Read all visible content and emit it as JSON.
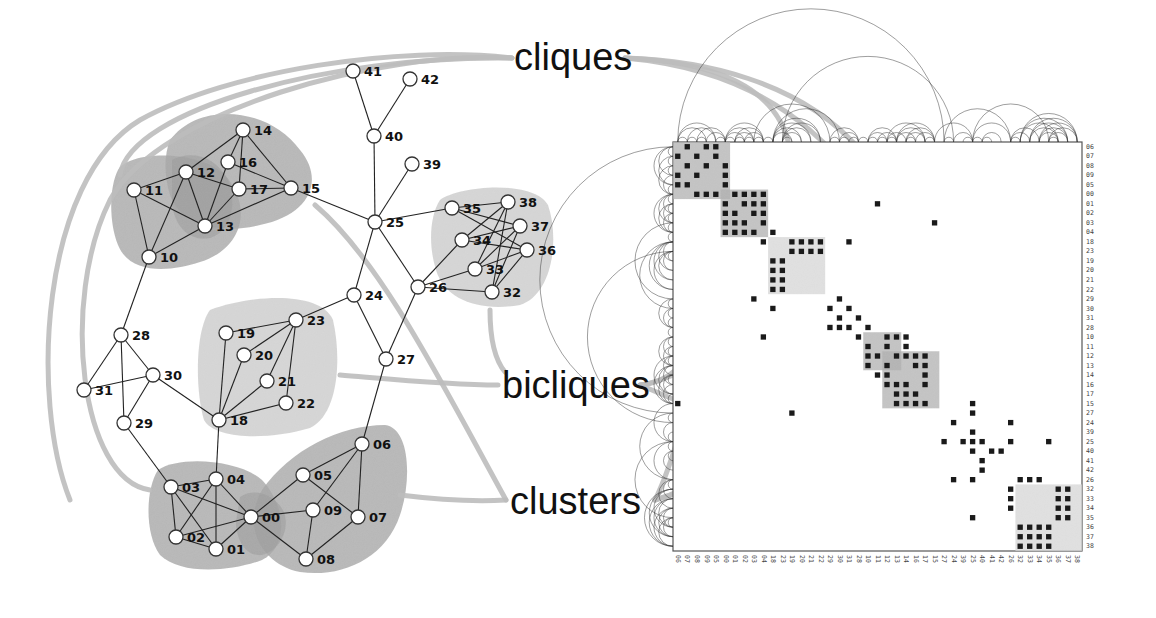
{
  "callouts": {
    "cliques": {
      "label": "cliques",
      "x": 514,
      "y": 40
    },
    "bicliques": {
      "label": "bicliques",
      "x": 502,
      "y": 368
    },
    "clusters": {
      "label": "clusters",
      "x": 510,
      "y": 483
    }
  },
  "colors": {
    "node_fill": "#ffffff",
    "node_stroke": "#333333",
    "edge": "#222222",
    "clique_hull": "#9a9a9a",
    "biclique_hull": "#cfcfcf",
    "cluster_hull": "#a8a8a8",
    "leader_line": "#bdbdbd",
    "matrix_cell": "#1a1a1a",
    "matrix_border": "#555555",
    "arc": "#333333"
  },
  "graph": {
    "nodes": [
      {
        "id": "00",
        "x": 251,
        "y": 517
      },
      {
        "id": "01",
        "x": 216,
        "y": 549
      },
      {
        "id": "02",
        "x": 176,
        "y": 537
      },
      {
        "id": "03",
        "x": 171,
        "y": 487
      },
      {
        "id": "04",
        "x": 216,
        "y": 479
      },
      {
        "id": "05",
        "x": 303,
        "y": 475
      },
      {
        "id": "06",
        "x": 362,
        "y": 444
      },
      {
        "id": "07",
        "x": 358,
        "y": 517
      },
      {
        "id": "08",
        "x": 306,
        "y": 559
      },
      {
        "id": "09",
        "x": 313,
        "y": 510
      },
      {
        "id": "10",
        "x": 149,
        "y": 257
      },
      {
        "id": "11",
        "x": 134,
        "y": 190
      },
      {
        "id": "12",
        "x": 186,
        "y": 172
      },
      {
        "id": "13",
        "x": 205,
        "y": 226
      },
      {
        "id": "14",
        "x": 243,
        "y": 130
      },
      {
        "id": "15",
        "x": 291,
        "y": 188
      },
      {
        "id": "16",
        "x": 228,
        "y": 162
      },
      {
        "id": "17",
        "x": 239,
        "y": 189
      },
      {
        "id": "18",
        "x": 219,
        "y": 420
      },
      {
        "id": "19",
        "x": 226,
        "y": 333
      },
      {
        "id": "20",
        "x": 244,
        "y": 355
      },
      {
        "id": "21",
        "x": 267,
        "y": 381
      },
      {
        "id": "22",
        "x": 286,
        "y": 403
      },
      {
        "id": "23",
        "x": 296,
        "y": 320
      },
      {
        "id": "24",
        "x": 354,
        "y": 295
      },
      {
        "id": "25",
        "x": 375,
        "y": 222
      },
      {
        "id": "26",
        "x": 418,
        "y": 287
      },
      {
        "id": "27",
        "x": 386,
        "y": 359
      },
      {
        "id": "28",
        "x": 121,
        "y": 335
      },
      {
        "id": "29",
        "x": 124,
        "y": 423
      },
      {
        "id": "30",
        "x": 153,
        "y": 375
      },
      {
        "id": "31",
        "x": 84,
        "y": 390
      },
      {
        "id": "32",
        "x": 492,
        "y": 292
      },
      {
        "id": "33",
        "x": 475,
        "y": 269
      },
      {
        "id": "34",
        "x": 462,
        "y": 240
      },
      {
        "id": "35",
        "x": 452,
        "y": 208
      },
      {
        "id": "36",
        "x": 527,
        "y": 250
      },
      {
        "id": "37",
        "x": 520,
        "y": 226
      },
      {
        "id": "38",
        "x": 508,
        "y": 202
      },
      {
        "id": "39",
        "x": 412,
        "y": 164
      },
      {
        "id": "40",
        "x": 374,
        "y": 136
      },
      {
        "id": "41",
        "x": 353,
        "y": 71
      },
      {
        "id": "42",
        "x": 410,
        "y": 79
      }
    ],
    "edges": [
      [
        "41",
        "40"
      ],
      [
        "42",
        "40"
      ],
      [
        "40",
        "25"
      ],
      [
        "39",
        "25"
      ],
      [
        "25",
        "15"
      ],
      [
        "25",
        "24"
      ],
      [
        "25",
        "26"
      ],
      [
        "25",
        "35"
      ],
      [
        "24",
        "23"
      ],
      [
        "24",
        "27"
      ],
      [
        "26",
        "27"
      ],
      [
        "26",
        "34"
      ],
      [
        "26",
        "33"
      ],
      [
        "26",
        "32"
      ],
      [
        "35",
        "38"
      ],
      [
        "35",
        "37"
      ],
      [
        "35",
        "36"
      ],
      [
        "34",
        "38"
      ],
      [
        "34",
        "37"
      ],
      [
        "34",
        "36"
      ],
      [
        "33",
        "38"
      ],
      [
        "33",
        "37"
      ],
      [
        "33",
        "36"
      ],
      [
        "32",
        "38"
      ],
      [
        "32",
        "37"
      ],
      [
        "32",
        "36"
      ],
      [
        "14",
        "12"
      ],
      [
        "14",
        "16"
      ],
      [
        "14",
        "17"
      ],
      [
        "14",
        "15"
      ],
      [
        "16",
        "15"
      ],
      [
        "16",
        "13"
      ],
      [
        "12",
        "17"
      ],
      [
        "12",
        "11"
      ],
      [
        "12",
        "13"
      ],
      [
        "12",
        "10"
      ],
      [
        "11",
        "10"
      ],
      [
        "11",
        "13"
      ],
      [
        "13",
        "17"
      ],
      [
        "13",
        "15"
      ],
      [
        "17",
        "15"
      ],
      [
        "13",
        "10"
      ],
      [
        "10",
        "28"
      ],
      [
        "28",
        "31"
      ],
      [
        "28",
        "30"
      ],
      [
        "28",
        "29"
      ],
      [
        "31",
        "30"
      ],
      [
        "30",
        "29"
      ],
      [
        "30",
        "18"
      ],
      [
        "29",
        "03"
      ],
      [
        "23",
        "19"
      ],
      [
        "23",
        "20"
      ],
      [
        "23",
        "21"
      ],
      [
        "23",
        "22"
      ],
      [
        "18",
        "19"
      ],
      [
        "18",
        "20"
      ],
      [
        "18",
        "21"
      ],
      [
        "18",
        "22"
      ],
      [
        "18",
        "04"
      ],
      [
        "27",
        "06"
      ],
      [
        "03",
        "04"
      ],
      [
        "03",
        "02"
      ],
      [
        "03",
        "01"
      ],
      [
        "03",
        "00"
      ],
      [
        "04",
        "02"
      ],
      [
        "04",
        "01"
      ],
      [
        "04",
        "00"
      ],
      [
        "02",
        "01"
      ],
      [
        "02",
        "00"
      ],
      [
        "01",
        "00"
      ],
      [
        "00",
        "05"
      ],
      [
        "00",
        "09"
      ],
      [
        "00",
        "08"
      ],
      [
        "05",
        "06"
      ],
      [
        "05",
        "07"
      ],
      [
        "06",
        "09"
      ],
      [
        "06",
        "07"
      ],
      [
        "07",
        "08"
      ],
      [
        "09",
        "08"
      ]
    ],
    "hulls": [
      {
        "kind": "cluster",
        "name": "cluster-10-13",
        "path": "M 118 170 C 130 150 200 150 225 175 C 255 210 240 250 200 262 C 170 272 130 275 118 245 C 108 220 110 185 118 170 Z"
      },
      {
        "kind": "cluster",
        "name": "cluster-12-17",
        "path": "M 170 140 C 200 100 270 108 300 150 C 325 180 310 215 260 225 C 220 235 180 225 170 195 C 164 175 164 155 170 140 Z"
      },
      {
        "kind": "clique",
        "name": "clique-12-13-overlap",
        "path": "M 172 160 C 190 150 215 155 228 180 C 238 205 230 232 210 238 C 188 242 175 225 172 205 Z"
      },
      {
        "kind": "biclique",
        "name": "biclique-18-23",
        "path": "M 210 310 C 250 295 320 290 333 320 C 342 360 338 415 310 428 C 270 440 215 440 204 420 C 195 390 195 330 210 310 Z"
      },
      {
        "kind": "biclique",
        "name": "biclique-32-38",
        "path": "M 440 200 C 460 185 535 180 548 205 C 560 240 552 295 520 305 C 480 312 445 300 436 270 C 428 245 430 215 440 200 Z"
      },
      {
        "kind": "cluster",
        "name": "cluster-00-04",
        "path": "M 158 470 C 180 455 240 460 262 480 C 285 505 290 545 262 560 C 230 572 180 575 160 555 C 145 535 145 490 158 470 Z"
      },
      {
        "kind": "cluster",
        "name": "cluster-05-09",
        "path": "M 262 490 C 290 450 340 425 385 425 C 410 428 412 480 400 515 C 385 560 340 578 300 572 C 265 565 240 530 262 490 Z"
      },
      {
        "kind": "clique",
        "name": "clique-00-overlap",
        "path": "M 240 497 C 255 487 275 495 284 512 C 290 530 280 550 262 555 C 246 557 236 540 236 522 Z"
      }
    ],
    "leader_lines": [
      {
        "to": "cliques",
        "path": "M 120 175 C 130 110 330 55 512 58"
      },
      {
        "to": "cliques",
        "path": "M 70 500 C 30 400 40 180 140 120 C 230 70 400 45 512 58"
      },
      {
        "to": "cliques",
        "path": "M 150 490 C 80 480 60 300 110 200 C 160 110 380 50 512 58"
      },
      {
        "to": "cliques",
        "path": "M 625 58 C 720 62 780 90 790 150"
      },
      {
        "to": "cliques",
        "path": "M 625 58 C 760 70 880 140 925 345"
      },
      {
        "to": "cliques",
        "path": "M 625 58 C 700 60 800 80 860 150 C 900 220 880 345 880 360"
      },
      {
        "to": "bicliques",
        "path": "M 340 375 C 400 380 450 385 498 385"
      },
      {
        "to": "bicliques",
        "path": "M 490 310 C 490 340 495 360 505 372"
      },
      {
        "to": "bicliques",
        "path": "M 640 385 C 680 380 760 330 810 302"
      },
      {
        "to": "bicliques",
        "path": "M 640 385 C 700 380 720 300 710 210"
      },
      {
        "to": "bicliques",
        "path": "M 640 385 C 700 410 900 500 1025 540"
      },
      {
        "to": "clusters",
        "path": "M 315 205 C 380 260 440 380 506 500"
      },
      {
        "to": "clusters",
        "path": "M 400 495 C 440 500 470 502 506 500"
      },
      {
        "to": "clusters",
        "path": "M 655 500 C 720 480 800 450 888 425"
      },
      {
        "to": "clusters",
        "path": "M 655 500 C 680 450 700 350 710 310"
      },
      {
        "to": "clusters",
        "path": "M 655 500 C 690 490 740 460 760 420"
      }
    ]
  },
  "matrix": {
    "x": 673,
    "y": 142,
    "size": 409,
    "n": 43,
    "order": [
      "06",
      "07",
      "08",
      "09",
      "05",
      "00",
      "01",
      "02",
      "03",
      "04",
      "18",
      "23",
      "19",
      "20",
      "21",
      "22",
      "29",
      "30",
      "31",
      "28",
      "10",
      "11",
      "12",
      "13",
      "14",
      "16",
      "17",
      "15",
      "27",
      "24",
      "39",
      "25",
      "40",
      "41",
      "42",
      "26",
      "32",
      "33",
      "34",
      "35",
      "36",
      "37",
      "38"
    ],
    "blocks": [
      {
        "kind": "cluster",
        "r0": 0,
        "r1": 5,
        "c0": 0,
        "c1": 5
      },
      {
        "kind": "cluster",
        "r0": 5,
        "r1": 9,
        "c0": 5,
        "c1": 9
      },
      {
        "kind": "biclique",
        "r0": 10,
        "r1": 15,
        "c0": 10,
        "c1": 15
      },
      {
        "kind": "cluster",
        "r0": 20,
        "r1": 23,
        "c0": 20,
        "c1": 23
      },
      {
        "kind": "cluster",
        "r0": 22,
        "r1": 27,
        "c0": 22,
        "c1": 27
      },
      {
        "kind": "biclique",
        "r0": 36,
        "r1": 42,
        "c0": 36,
        "c1": 42
      }
    ],
    "cells": [
      [
        0,
        1
      ],
      [
        0,
        3
      ],
      [
        0,
        4
      ],
      [
        1,
        0
      ],
      [
        1,
        2
      ],
      [
        1,
        4
      ],
      [
        2,
        1
      ],
      [
        2,
        3
      ],
      [
        2,
        5
      ],
      [
        3,
        0
      ],
      [
        3,
        2
      ],
      [
        3,
        5
      ],
      [
        4,
        0
      ],
      [
        4,
        1
      ],
      [
        4,
        5
      ],
      [
        5,
        2
      ],
      [
        5,
        3
      ],
      [
        5,
        4
      ],
      [
        5,
        6
      ],
      [
        5,
        7
      ],
      [
        5,
        8
      ],
      [
        5,
        9
      ],
      [
        6,
        5
      ],
      [
        6,
        7
      ],
      [
        6,
        8
      ],
      [
        6,
        9
      ],
      [
        7,
        5
      ],
      [
        7,
        6
      ],
      [
        7,
        8
      ],
      [
        7,
        9
      ],
      [
        8,
        5
      ],
      [
        8,
        6
      ],
      [
        8,
        7
      ],
      [
        8,
        9
      ],
      [
        9,
        5
      ],
      [
        9,
        6
      ],
      [
        9,
        7
      ],
      [
        9,
        8
      ],
      [
        9,
        10
      ],
      [
        10,
        9
      ],
      [
        10,
        12
      ],
      [
        10,
        13
      ],
      [
        10,
        14
      ],
      [
        10,
        15
      ],
      [
        10,
        18
      ],
      [
        11,
        12
      ],
      [
        11,
        13
      ],
      [
        11,
        14
      ],
      [
        11,
        15
      ],
      [
        12,
        10
      ],
      [
        12,
        11
      ],
      [
        13,
        10
      ],
      [
        13,
        11
      ],
      [
        14,
        10
      ],
      [
        14,
        11
      ],
      [
        15,
        10
      ],
      [
        15,
        11
      ],
      [
        6,
        21
      ],
      [
        16,
        8
      ],
      [
        17,
        16
      ],
      [
        16,
        17
      ],
      [
        17,
        18
      ],
      [
        18,
        17
      ],
      [
        18,
        19
      ],
      [
        19,
        16
      ],
      [
        19,
        17
      ],
      [
        19,
        18
      ],
      [
        19,
        20
      ],
      [
        17,
        10
      ],
      [
        8,
        27
      ],
      [
        20,
        19
      ],
      [
        20,
        22
      ],
      [
        20,
        23
      ],
      [
        20,
        24
      ],
      [
        21,
        20
      ],
      [
        21,
        22
      ],
      [
        21,
        24
      ],
      [
        22,
        20
      ],
      [
        22,
        21
      ],
      [
        22,
        23
      ],
      [
        22,
        24
      ],
      [
        22,
        25
      ],
      [
        22,
        26
      ],
      [
        23,
        20
      ],
      [
        23,
        22
      ],
      [
        23,
        25
      ],
      [
        23,
        26
      ],
      [
        24,
        21
      ],
      [
        24,
        22
      ],
      [
        24,
        26
      ],
      [
        25,
        22
      ],
      [
        25,
        23
      ],
      [
        25,
        24
      ],
      [
        25,
        26
      ],
      [
        26,
        23
      ],
      [
        26,
        24
      ],
      [
        26,
        25
      ],
      [
        27,
        23
      ],
      [
        27,
        24
      ],
      [
        27,
        25
      ],
      [
        27,
        26
      ],
      [
        27,
        31
      ],
      [
        28,
        31
      ],
      [
        29,
        29
      ],
      [
        29,
        35
      ],
      [
        30,
        31
      ],
      [
        31,
        28
      ],
      [
        31,
        30
      ],
      [
        31,
        31
      ],
      [
        31,
        32
      ],
      [
        31,
        35
      ],
      [
        31,
        39
      ],
      [
        32,
        31
      ],
      [
        32,
        33
      ],
      [
        32,
        34
      ],
      [
        33,
        32
      ],
      [
        34,
        32
      ],
      [
        35,
        29
      ],
      [
        35,
        31
      ],
      [
        27,
        0
      ],
      [
        28,
        12
      ],
      [
        20,
        9
      ],
      [
        35,
        36
      ],
      [
        35,
        37
      ],
      [
        35,
        38
      ],
      [
        36,
        35
      ],
      [
        37,
        35
      ],
      [
        38,
        35
      ],
      [
        39,
        31
      ],
      [
        36,
        40
      ],
      [
        36,
        41
      ],
      [
        37,
        40
      ],
      [
        37,
        41
      ],
      [
        38,
        40
      ],
      [
        38,
        41
      ],
      [
        39,
        40
      ],
      [
        39,
        41
      ],
      [
        40,
        36
      ],
      [
        40,
        37
      ],
      [
        40,
        38
      ],
      [
        40,
        39
      ],
      [
        41,
        36
      ],
      [
        41,
        37
      ],
      [
        41,
        38
      ],
      [
        41,
        39
      ],
      [
        42,
        36
      ],
      [
        42,
        37
      ],
      [
        42,
        38
      ],
      [
        42,
        39
      ]
    ]
  }
}
